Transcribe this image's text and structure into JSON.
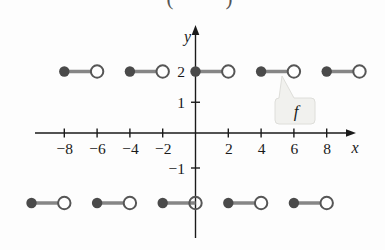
{
  "figure": {
    "background": "#fdfdfd",
    "cropped_caption_fragments": {
      "left": "(",
      "right": ")"
    }
  },
  "chart_data": {
    "type": "line",
    "subtype": "step-function-horizontal-segments",
    "title": "",
    "xlabel": "x",
    "ylabel": "y",
    "function_label": "f",
    "grid": false,
    "legend_position": "callout-bubble-near-(5.3,1.5)",
    "xlim": [
      -10.5,
      10.5
    ],
    "ylim": [
      -2.6,
      3.3
    ],
    "x_ticks": [
      {
        "value": -8,
        "label": "−8"
      },
      {
        "value": -6,
        "label": "−6"
      },
      {
        "value": -4,
        "label": "−4"
      },
      {
        "value": -2,
        "label": "−2"
      },
      {
        "value": 2,
        "label": "2"
      },
      {
        "value": 4,
        "label": "4"
      },
      {
        "value": 6,
        "label": "6"
      },
      {
        "value": 8,
        "label": "8"
      }
    ],
    "y_ticks": [
      {
        "value": 2,
        "label": "2",
        "tick_mark": false
      },
      {
        "value": 1,
        "label": "1",
        "tick_mark": true
      },
      {
        "value": -1,
        "label": "−1",
        "tick_mark": true
      }
    ],
    "segments": [
      {
        "y": 2,
        "x_start": -8,
        "x_end": -6,
        "left_endpoint": "closed",
        "right_endpoint": "open"
      },
      {
        "y": 2,
        "x_start": -4,
        "x_end": -2,
        "left_endpoint": "closed",
        "right_endpoint": "open"
      },
      {
        "y": 2,
        "x_start": 0,
        "x_end": 2,
        "left_endpoint": "closed",
        "right_endpoint": "open"
      },
      {
        "y": 2,
        "x_start": 4,
        "x_end": 6,
        "left_endpoint": "closed",
        "right_endpoint": "open"
      },
      {
        "y": 2,
        "x_start": 8,
        "x_end": 10,
        "left_endpoint": "closed",
        "right_endpoint": "open"
      },
      {
        "y": -2,
        "x_start": -10,
        "x_end": -8,
        "left_endpoint": "closed",
        "right_endpoint": "open"
      },
      {
        "y": -2,
        "x_start": -6,
        "x_end": -4,
        "left_endpoint": "closed",
        "right_endpoint": "open"
      },
      {
        "y": -2,
        "x_start": -2,
        "x_end": 0,
        "left_endpoint": "closed",
        "right_endpoint": "open",
        "open_endpoint_on_axis": true
      },
      {
        "y": -2,
        "x_start": 2,
        "x_end": 4,
        "left_endpoint": "closed",
        "right_endpoint": "open"
      },
      {
        "y": -2,
        "x_start": 6,
        "x_end": 8,
        "left_endpoint": "closed",
        "right_endpoint": "open"
      }
    ],
    "colors": {
      "axis": "#1a1a1a",
      "tick_text": "#1a1a1a",
      "segment_line": "#868686",
      "closed_dot_fill": "#4a4a4a",
      "open_circle_stroke": "#565656",
      "open_circle_fill": "#ffffff",
      "callout_fill": "#f1f1ee",
      "callout_border": "#dededa",
      "function_label_color": "#1c1c1c",
      "caption_fragment_color": "#555555"
    }
  }
}
